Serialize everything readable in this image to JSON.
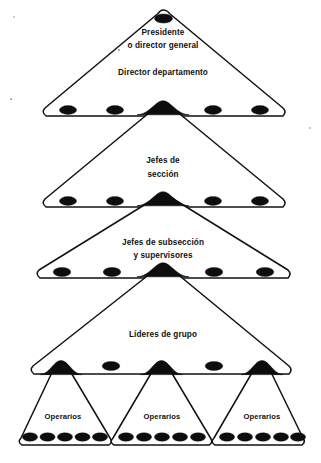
{
  "diagram": {
    "type": "nested-triangle-hierarchy",
    "background_color": "#ffffff",
    "ink_color": "#111111",
    "levels": [
      {
        "id": "level-1",
        "label": "Presidente\no director general",
        "label_lines": [
          "Presidente",
          "o director general"
        ],
        "nodes": 1,
        "node_style": "filled-ellipse"
      },
      {
        "id": "level-2",
        "label": "Director departamento",
        "label_lines": [
          "Director departamento"
        ],
        "nodes": 5,
        "node_style": "filled-ellipse"
      },
      {
        "id": "level-3",
        "label": "Jefes de\nsección",
        "label_lines": [
          "Jefes de",
          "sección"
        ],
        "nodes": 5,
        "node_style": "filled-ellipse"
      },
      {
        "id": "level-4",
        "label": "Jefes de subsección\ny supervisores",
        "label_lines": [
          "Jefes de subsección",
          "y supervisores"
        ],
        "nodes": 5,
        "node_style": "filled-ellipse"
      },
      {
        "id": "level-5",
        "label": "Líderes de grupo",
        "label_lines": [
          "Líderes de grupo"
        ],
        "nodes": 5,
        "node_style": "filled-ellipse"
      },
      {
        "id": "level-6",
        "label": "Operarios",
        "label_lines": [
          "Operarios"
        ],
        "groups": 3,
        "nodes_per_group": 5,
        "node_style": "filled-ellipse"
      }
    ],
    "labels": {
      "l1_line1": "Presidente",
      "l1_line2": "o director general",
      "l2_line1": "Director departamento",
      "l3_line1": "Jefes de",
      "l3_line2": "sección",
      "l4_line1": "Jefes de subsección",
      "l4_line2": "y supervisores",
      "l5_line1": "Líderes de grupo",
      "l6_group1": "Operarios",
      "l6_group2": "Operarios",
      "l6_group3": "Operarios"
    }
  }
}
